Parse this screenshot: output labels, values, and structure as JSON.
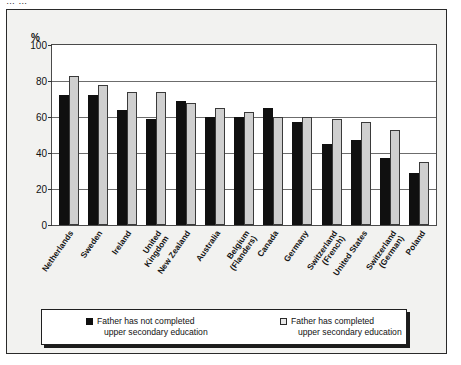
{
  "caption": {
    "cropped_top_text": "… …"
  },
  "axis": {
    "y_unit": "%",
    "y_ticks": [
      100,
      80,
      60,
      40,
      20,
      0
    ]
  },
  "legend": {
    "items": [
      {
        "swatch": "dark",
        "line1": "Father has not completed",
        "line2": "upper secondary education"
      },
      {
        "swatch": "light",
        "line1": "Father has completed",
        "line2": "upper secondary education"
      }
    ]
  },
  "chart_data": {
    "type": "bar",
    "title": "",
    "subtitle": "",
    "xlabel": "",
    "ylabel": "%",
    "ylim": [
      0,
      100
    ],
    "ytick_step": 20,
    "grid": true,
    "legend_position": "bottom",
    "categories": [
      "Netherlands",
      "Sweden",
      "Ireland",
      "United\nKingdom",
      "New Zealand",
      "Australia",
      "Belgium\n(Flanders)",
      "Canada",
      "Germany",
      "Switzerland\n(French)",
      "United States",
      "Switzerland\n(German)",
      "Poland"
    ],
    "series": [
      {
        "name": "Father has not completed upper secondary education",
        "color": "#101010",
        "values": [
          72,
          72,
          64,
          59,
          69,
          60,
          60,
          65,
          57,
          45,
          47,
          37,
          29
        ]
      },
      {
        "name": "Father has completed upper secondary education",
        "color": "#cfcfcf",
        "values": [
          83,
          78,
          74,
          74,
          68,
          65,
          63,
          60,
          60,
          59,
          57,
          53,
          35
        ]
      }
    ]
  }
}
